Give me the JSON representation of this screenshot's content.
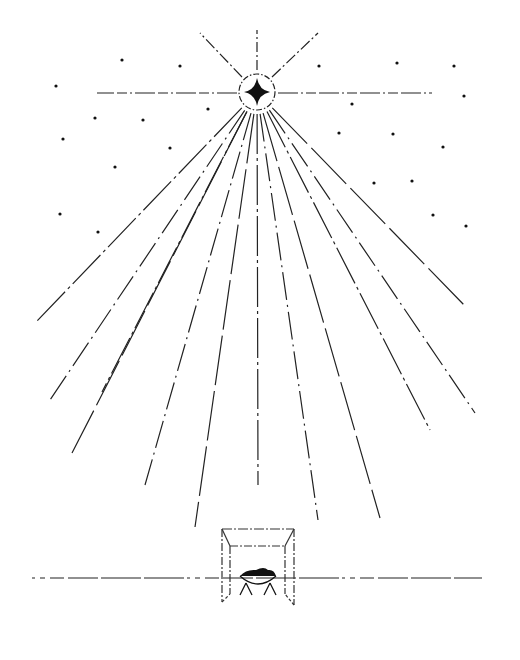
{
  "illustration": {
    "subject": "Nativity scene: star of Bethlehem shining over a stable with a manger",
    "colors": {
      "background": "#ffffff",
      "ink": "#111111"
    },
    "elements": {
      "star": "four-pointed star inside a dashed ring",
      "upper_rays": 5,
      "lower_fan_rays": 11,
      "background_stars": 23,
      "ground_line": "dashed horizon line",
      "stable": "open box drawn in perspective",
      "manger": "crib with swaddled infant"
    }
  }
}
